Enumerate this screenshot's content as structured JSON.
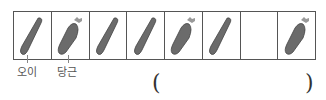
{
  "problem": {
    "sequence": [
      "cucumber",
      "carrot",
      "cucumber",
      "cucumber",
      "carrot",
      "cucumber",
      "empty",
      "carrot"
    ],
    "labels": {
      "cucumber": "오이",
      "carrot": "당근"
    },
    "answer_open": "(",
    "answer_close": ")"
  },
  "colors": {
    "veg_fill": "#6b6b6b",
    "border": "#555555"
  }
}
